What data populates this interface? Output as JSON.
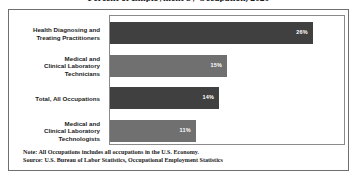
{
  "chart_title": "Percent of Employment by Occupation, 2020",
  "chart_data": {
    "type": "bar",
    "orientation": "horizontal",
    "title": "Percent of Employment by Occupation, 2020",
    "xlabel": "",
    "ylabel": "",
    "xlim": [
      0,
      30
    ],
    "grid": false,
    "legend": "none",
    "categories": [
      "Health Diagnosing and Treating Practitioners",
      "Medical and Clinical Laboratory Technicians",
      "Total, All Occupations",
      "Medical and Clinical Laboratory Technologists"
    ],
    "values": [
      26,
      15,
      14,
      11
    ],
    "value_labels": [
      "26%",
      "15%",
      "14%",
      "11%"
    ],
    "bar_colors": [
      "#404040",
      "#707070",
      "#404040",
      "#707070"
    ]
  },
  "category_label_lines": [
    [
      "Health Diagnosing and",
      "Treating Practitioners"
    ],
    [
      "Medical and",
      "Clinical Laboratory",
      "Technicians"
    ],
    [
      "Total, All Occupations"
    ],
    [
      "Medical and",
      "Clinical Laboratory",
      "Technologists"
    ]
  ],
  "notes": {
    "note_line": "Note: All Occupations includes all occupations in the U.S. Economy.",
    "source_line": "Source: U.S. Bureau of Labor Statistics, Occupational Employment Statistics"
  },
  "colors": {
    "bar_dark": "#404040",
    "bar_light": "#707070",
    "frame": "#6f6f6f",
    "plot_border": "#8a8a8a",
    "text": "#1a1a1a",
    "value_text": "#ffffff",
    "background": "#ffffff"
  }
}
